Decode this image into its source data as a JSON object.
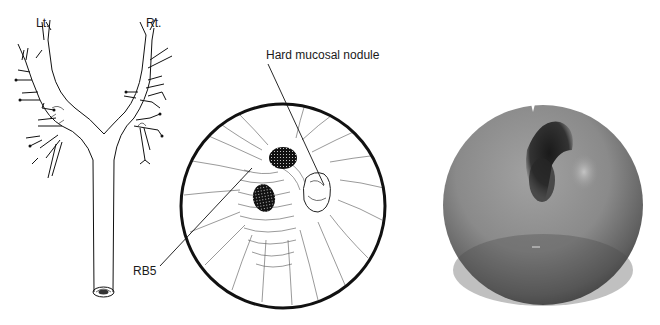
{
  "figure": {
    "panels": [
      {
        "id": "bronchial-tree",
        "type": "line-drawing",
        "labels": {
          "left": "Lt.",
          "right": "Rt."
        }
      },
      {
        "id": "bronchoscopic-view-drawing",
        "type": "circular-line-drawing",
        "annotations": {
          "nodule": "Hard mucosal nodule",
          "segment": "RB5"
        }
      },
      {
        "id": "bronchoscopic-photo",
        "type": "grayscale-endoscopic-photo"
      }
    ]
  },
  "colors": {
    "ink": "#111111",
    "photo_light": "#9a9a9a",
    "photo_mid": "#6e6e6e",
    "photo_dark": "#2a2a2a",
    "nodule_highlight": "#b8b8b8"
  }
}
